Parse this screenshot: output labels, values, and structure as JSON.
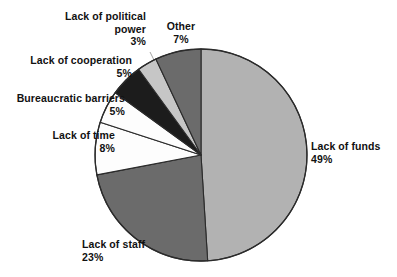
{
  "chart_data": {
    "type": "pie",
    "title": "",
    "subtitle": "",
    "xlabel": "",
    "ylabel": "",
    "legend_position": "none",
    "grid": false,
    "start_angle_deg": 0,
    "direction": "clockwise",
    "categories": [
      "Lack of funds",
      "Lack of staff",
      "Lack of time",
      "Bureaucratic barriers",
      "Lack of cooperation",
      "Lack of political power",
      "Other"
    ],
    "values": [
      49,
      23,
      8,
      5,
      5,
      3,
      7
    ],
    "units": "%",
    "slices": [
      {
        "label": "Lack of funds",
        "value": 49,
        "pct_text": "49%",
        "color": "#b2b2b2"
      },
      {
        "label": "Lack of staff",
        "value": 23,
        "pct_text": "23%",
        "color": "#6b6b6b"
      },
      {
        "label": "Lack of time",
        "value": 8,
        "pct_text": "8%",
        "color": "#fdfdfd"
      },
      {
        "label": "Bureaucratic barriers",
        "value": 5,
        "pct_text": "5%",
        "color": "#fdfdfd"
      },
      {
        "label": "Lack of cooperation",
        "value": 5,
        "pct_text": "5%",
        "color": "#1c1c1c"
      },
      {
        "label": "Lack of political power",
        "value": 3,
        "pct_text": "3%",
        "color": "#c6c6c6"
      },
      {
        "label": "Other",
        "value": 7,
        "pct_text": "7%",
        "color": "#6b6b6b"
      }
    ]
  },
  "labels": {
    "funds": {
      "name": "Lack of funds",
      "pct": "49%"
    },
    "staff": {
      "name": "Lack of staff",
      "pct": "23%"
    },
    "time": {
      "name": "Lack of time",
      "pct": "8%"
    },
    "bureau": {
      "name": "Bureaucratic barriers",
      "pct": "5%"
    },
    "coop": {
      "name": "Lack of cooperation",
      "pct": "5%"
    },
    "political_line1": "Lack of political",
    "political_line2": "power",
    "political": {
      "name": "Lack of political power",
      "pct": "3%"
    },
    "other": {
      "name": "Other",
      "pct": "7%"
    }
  },
  "colors": {
    "background": "#ffffff",
    "outline": "#2b2b2b",
    "text": "#111111",
    "light_gray": "#b2b2b2",
    "dark_gray": "#6b6b6b",
    "near_black": "#1c1c1c",
    "pale_gray": "#c6c6c6",
    "white": "#fdfdfd"
  }
}
